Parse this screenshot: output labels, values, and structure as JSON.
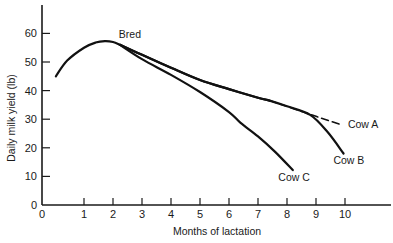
{
  "chart_data": {
    "type": "line",
    "title": "",
    "xlabel": "Months of lactation",
    "ylabel": "Daily milk yield (lb)",
    "xlim": [
      0,
      11.5
    ],
    "ylim": [
      0,
      70
    ],
    "grid": false,
    "legend": "none (series labeled inline)",
    "x_ticks": [
      0,
      1,
      2,
      3,
      4,
      5,
      6,
      7,
      8,
      9,
      10
    ],
    "y_ticks": [
      0,
      10,
      20,
      30,
      40,
      50,
      60
    ],
    "shared_curve": {
      "name": "Early lactation (all cows)",
      "x": [
        0.33,
        0.6,
        1.0,
        1.4,
        1.72,
        2.0,
        2.24
      ],
      "y": [
        45,
        50.5,
        55,
        56.8,
        57.3,
        57,
        56
      ]
    },
    "series": [
      {
        "name": "Cow A",
        "style": "solid then dashed after 7.4 months",
        "x": [
          2.24,
          3,
          4,
          5,
          6,
          7,
          7.4,
          8,
          9,
          9.9
        ],
        "y": [
          56,
          52.5,
          48,
          43.7,
          40.5,
          37.5,
          36.5,
          34.5,
          31,
          28
        ]
      },
      {
        "name": "Cow B",
        "style": "solid",
        "x": [
          2.24,
          3,
          4,
          5,
          6,
          7,
          7.4,
          8,
          8.8,
          9.4,
          9.95
        ],
        "y": [
          56,
          52.5,
          48,
          43.7,
          40.5,
          37.5,
          36.5,
          34.5,
          31.5,
          25.5,
          18
        ]
      },
      {
        "name": "Cow C",
        "style": "solid",
        "x": [
          2.24,
          3,
          4,
          5,
          6,
          6.4,
          7,
          7.6,
          8.2
        ],
        "y": [
          56,
          51,
          45.5,
          39.5,
          32.5,
          28.7,
          24,
          18.5,
          12.2
        ]
      }
    ],
    "annotations": [
      {
        "text": "Bred",
        "x": 2.2,
        "y": 58.5
      },
      {
        "text": "Cow A",
        "x": 10.1,
        "y": 27
      },
      {
        "text": "Cow B",
        "x": 9.6,
        "y": 14.5
      },
      {
        "text": "Cow C",
        "x": 7.7,
        "y": 8.5
      }
    ]
  }
}
